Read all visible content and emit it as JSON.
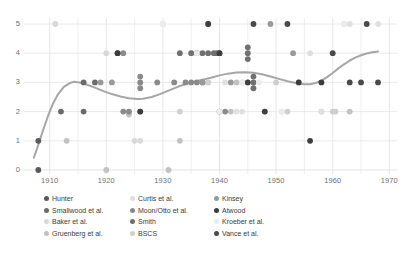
{
  "chart_data": {
    "type": "scatter",
    "title": "",
    "subtitle": "",
    "xlabel": "",
    "ylabel": "",
    "xlim": [
      1906,
      1971
    ],
    "ylim": [
      0,
      5
    ],
    "xticks": [
      1910,
      1920,
      1930,
      1940,
      1950,
      1960,
      1970
    ],
    "yticks": [
      0,
      1,
      2,
      3,
      4,
      5
    ],
    "xtick_labels": [
      "1910",
      "1920",
      "1930",
      "1940",
      "1950",
      "1960",
      "1970"
    ],
    "ytick_labels": [
      "0",
      "1",
      "2",
      "3",
      "4",
      "5"
    ],
    "grid": true,
    "grid_color": "#e4e4e6",
    "legend_position": "bottom",
    "legend_columns": 3,
    "series": [
      {
        "name": "Hunter",
        "color": "#595959",
        "points": [
          [
            1908,
            0
          ],
          [
            1908,
            1
          ]
        ]
      },
      {
        "name": "Smallwood et al.",
        "color": "#6b6b6b",
        "points": [
          [
            1912,
            2
          ],
          [
            1916,
            2
          ],
          [
            1916,
            3
          ],
          [
            1918,
            3
          ]
        ]
      },
      {
        "name": "Baker et al.",
        "color": "#d9d9d9",
        "points": [
          [
            1911,
            5
          ],
          [
            1920,
            4
          ],
          [
            1924,
            2
          ],
          [
            1925,
            1
          ],
          [
            1926,
            1
          ]
        ]
      },
      {
        "name": "Gruenberg et al.",
        "color": "#c2c2c2",
        "points": [
          [
            1913,
            1
          ],
          [
            1920,
            0
          ],
          [
            1924,
            1.9
          ],
          [
            1931,
            0
          ],
          [
            1933,
            1
          ],
          [
            1942,
            2
          ],
          [
            1943,
            3
          ],
          [
            1948,
            2
          ],
          [
            1958,
            2
          ],
          [
            1963,
            2
          ]
        ]
      },
      {
        "name": "Curtis et al.",
        "color": "#e0e0e0",
        "points": [
          [
            1930,
            5
          ],
          [
            1935,
            4
          ],
          [
            1938,
            3
          ],
          [
            1941,
            3
          ],
          [
            1943,
            2
          ],
          [
            1944,
            2
          ],
          [
            1945,
            3
          ],
          [
            1956,
            4
          ],
          [
            1958,
            2
          ],
          [
            1962,
            5
          ],
          [
            1963,
            5
          ],
          [
            1968,
            5
          ]
        ]
      },
      {
        "name": "Moon/Otto et al.",
        "color": "#8a8a8a",
        "points": [
          [
            1922,
            4
          ],
          [
            1923,
            4
          ],
          [
            1923,
            2
          ],
          [
            1924,
            2
          ],
          [
            1926,
            3
          ],
          [
            1926,
            3.2
          ],
          [
            1926,
            2.8
          ],
          [
            1929,
            3
          ],
          [
            1932,
            3
          ],
          [
            1934,
            3
          ],
          [
            1935,
            3
          ],
          [
            1936,
            3
          ],
          [
            1937,
            3
          ],
          [
            1940,
            2
          ],
          [
            1941,
            2
          ]
        ]
      },
      {
        "name": "Smith",
        "color": "#707070",
        "points": [
          [
            1933,
            4
          ],
          [
            1935,
            4
          ],
          [
            1936,
            4
          ],
          [
            1937,
            4
          ],
          [
            1938,
            4
          ],
          [
            1939,
            4
          ],
          [
            1939.5,
            4
          ],
          [
            1940,
            4
          ],
          [
            1945,
            4
          ],
          [
            1945,
            4.2
          ],
          [
            1945,
            3.8
          ],
          [
            1946,
            3
          ],
          [
            1946,
            3.2
          ],
          [
            1946,
            2.8
          ]
        ]
      },
      {
        "name": "BSCS",
        "color": "#cfcfcf",
        "points": [
          [
            1933,
            2
          ],
          [
            1938,
            3
          ],
          [
            1944,
            3
          ],
          [
            1950,
            3
          ],
          [
            1951,
            2
          ],
          [
            1952,
            2
          ],
          [
            1954,
            3
          ],
          [
            1960,
            2
          ],
          [
            1960.5,
            2
          ]
        ]
      },
      {
        "name": "Kinsey",
        "color": "#9a9a9a",
        "points": [
          [
            1919,
            3
          ],
          [
            1921,
            3
          ],
          [
            1926,
            2
          ],
          [
            1937,
            3
          ],
          [
            1938,
            5
          ],
          [
            1942,
            3
          ],
          [
            1949,
            5
          ],
          [
            1953,
            4
          ]
        ]
      },
      {
        "name": "Atwood",
        "color": "#3d3d3d",
        "points": [
          [
            1922,
            4
          ],
          [
            1926,
            2
          ],
          [
            1938,
            5
          ],
          [
            1940,
            4
          ],
          [
            1945,
            3
          ],
          [
            1948,
            2
          ],
          [
            1954,
            3
          ],
          [
            1956,
            1
          ],
          [
            1958,
            3
          ]
        ]
      },
      {
        "name": "Kroeber et al.",
        "color": "#ebebeb",
        "points": [
          [
            1930,
            5
          ],
          [
            1936,
            4
          ],
          [
            1940,
            2
          ],
          [
            1944,
            3
          ],
          [
            1947,
            3
          ],
          [
            1951,
            2
          ],
          [
            1962,
            5
          ]
        ]
      },
      {
        "name": "Vance et al.",
        "color": "#4a4a4a",
        "points": [
          [
            1946,
            5
          ],
          [
            1952,
            5
          ],
          [
            1960,
            4
          ],
          [
            1963,
            3
          ],
          [
            1965,
            3
          ],
          [
            1966,
            5
          ],
          [
            1968,
            3
          ]
        ]
      }
    ],
    "trend_line": {
      "name": "smoothed trend",
      "color": "#a6a6a6",
      "width": 2,
      "points": [
        [
          1907.2,
          0.42
        ],
        [
          1907.8,
          0.75
        ],
        [
          1908.3,
          1.05
        ],
        [
          1909.0,
          1.45
        ],
        [
          1909.8,
          1.9
        ],
        [
          1910.6,
          2.28
        ],
        [
          1911.5,
          2.6
        ],
        [
          1912.5,
          2.85
        ],
        [
          1913.5,
          2.97
        ],
        [
          1914.3,
          3.02
        ],
        [
          1915.2,
          3.0
        ],
        [
          1916.5,
          2.93
        ],
        [
          1918.0,
          2.82
        ],
        [
          1919.5,
          2.7
        ],
        [
          1921.0,
          2.6
        ],
        [
          1922.5,
          2.52
        ],
        [
          1924.0,
          2.46
        ],
        [
          1925.5,
          2.43
        ],
        [
          1926.5,
          2.44
        ],
        [
          1928.0,
          2.5
        ],
        [
          1929.5,
          2.6
        ],
        [
          1931.0,
          2.72
        ],
        [
          1932.5,
          2.84
        ],
        [
          1934.0,
          2.94
        ],
        [
          1935.5,
          3.02
        ],
        [
          1937.0,
          3.09
        ],
        [
          1938.5,
          3.16
        ],
        [
          1940.0,
          3.24
        ],
        [
          1941.5,
          3.3
        ],
        [
          1943.0,
          3.34
        ],
        [
          1944.5,
          3.35
        ],
        [
          1946.0,
          3.33
        ],
        [
          1947.5,
          3.28
        ],
        [
          1949.0,
          3.2
        ],
        [
          1950.5,
          3.12
        ],
        [
          1952.0,
          3.04
        ],
        [
          1953.5,
          2.98
        ],
        [
          1955.0,
          2.94
        ],
        [
          1956.0,
          2.94
        ],
        [
          1957.0,
          2.98
        ],
        [
          1958.0,
          3.06
        ],
        [
          1959.0,
          3.18
        ],
        [
          1960.0,
          3.32
        ],
        [
          1961.0,
          3.48
        ],
        [
          1962.0,
          3.62
        ],
        [
          1963.0,
          3.75
        ],
        [
          1964.0,
          3.85
        ],
        [
          1965.0,
          3.93
        ],
        [
          1966.0,
          3.99
        ],
        [
          1967.0,
          4.03
        ],
        [
          1968.0,
          4.06
        ]
      ]
    }
  },
  "legend": {
    "columns": [
      {
        "items": [
          {
            "label": "Hunter",
            "color": "#595959"
          },
          {
            "label": "Smallwood et al.",
            "color": "#6b6b6b"
          },
          {
            "label": "Baker et al.",
            "color": "#d9d9d9"
          },
          {
            "label": "Gruenberg et al.",
            "color": "#c2c2c2"
          }
        ]
      },
      {
        "items": [
          {
            "label": "Curtis et al.",
            "color": "#e0e0e0"
          },
          {
            "label": "Moon/Otto et al.",
            "color": "#8a8a8a"
          },
          {
            "label": "Smith",
            "color": "#707070"
          },
          {
            "label": "BSCS",
            "color": "#cfcfcf"
          }
        ]
      },
      {
        "items": [
          {
            "label": "Kinsey",
            "color": "#9a9a9a"
          },
          {
            "label": "Atwood",
            "color": "#3d3d3d"
          },
          {
            "label": "Kroeber et al.",
            "color": "#ebebeb"
          },
          {
            "label": "Vance et al.",
            "color": "#4a4a4a"
          }
        ]
      }
    ]
  }
}
